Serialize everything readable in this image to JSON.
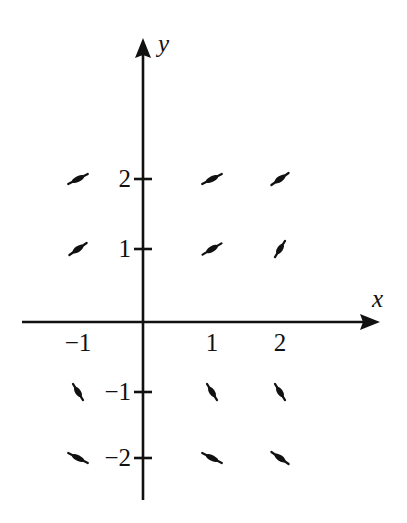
{
  "figure": {
    "type": "direction-field-plot",
    "background_color": "#ffffff",
    "ink_color": "#111111",
    "width": 407,
    "height": 523
  },
  "axes": {
    "x_axis": {
      "label": "x",
      "label_style": "italic",
      "arrow": "right",
      "pixel_y": 322,
      "pixel_x_start": 22,
      "pixel_x_end": 380,
      "tick_labels": [
        "-1",
        "1",
        "2"
      ],
      "tick_label_display": [
        "−1",
        "1",
        "2"
      ],
      "tick_values": [
        -1,
        1,
        2
      ],
      "tick_pixel_x": [
        78,
        212,
        280
      ],
      "tick_label_pixel_y": 330
    },
    "y_axis": {
      "label": "y",
      "label_style": "italic",
      "arrow": "up",
      "pixel_x": 143,
      "pixel_y_start": 38,
      "pixel_y_end": 500,
      "tick_labels": [
        "2",
        "1",
        "-1",
        "-2"
      ],
      "tick_label_display": [
        "2",
        "1",
        "−1",
        "−2"
      ],
      "tick_values": [
        2,
        1,
        -1,
        -2
      ],
      "tick_pixel_y": [
        179,
        249,
        392,
        458
      ],
      "tick_mark_half_width": 9
    },
    "origin_pixel": {
      "x": 143,
      "y": 322
    }
  },
  "chart_data": {
    "type": "scatter",
    "title": "",
    "xlabel": "x",
    "ylabel": "y",
    "grid": false,
    "legend": false,
    "xlim": [
      -1.8,
      2.9
    ],
    "ylim": [
      -2.7,
      2.9
    ],
    "marker": "slope-segment",
    "x": [
      -1,
      1,
      2,
      -1,
      1,
      2,
      -1,
      1,
      2,
      -1,
      1,
      2
    ],
    "y": [
      2,
      2,
      2,
      1,
      1,
      1,
      -1,
      -1,
      -1,
      -2,
      -2,
      -2
    ],
    "slopes": [
      0.5,
      0.5,
      0.7,
      0.7,
      0.7,
      1.6,
      -1.6,
      -1.6,
      -1.6,
      -0.5,
      -0.5,
      -0.7
    ],
    "points": [
      {
        "x": -1,
        "y": 2,
        "slope": 0.5,
        "angle_deg": -27,
        "px": 78,
        "py": 179,
        "length": 22
      },
      {
        "x": 1,
        "y": 2,
        "slope": 0.5,
        "angle_deg": -27,
        "px": 212,
        "py": 179,
        "length": 22
      },
      {
        "x": 2,
        "y": 2,
        "slope": 0.7,
        "angle_deg": -35,
        "px": 280,
        "py": 179,
        "length": 21
      },
      {
        "x": -1,
        "y": 1,
        "slope": 0.7,
        "angle_deg": -35,
        "px": 78,
        "py": 249,
        "length": 21
      },
      {
        "x": 1,
        "y": 1,
        "slope": 0.6,
        "angle_deg": -31,
        "px": 212,
        "py": 249,
        "length": 22
      },
      {
        "x": 2,
        "y": 1,
        "slope": 1.6,
        "angle_deg": -58,
        "px": 280,
        "py": 249,
        "length": 19
      },
      {
        "x": -1,
        "y": -1,
        "slope": -1.6,
        "angle_deg": 58,
        "px": 78,
        "py": 392,
        "length": 19
      },
      {
        "x": 1,
        "y": -1,
        "slope": -1.6,
        "angle_deg": 58,
        "px": 212,
        "py": 392,
        "length": 19
      },
      {
        "x": 2,
        "y": -1,
        "slope": -1.6,
        "angle_deg": 58,
        "px": 280,
        "py": 392,
        "length": 19
      },
      {
        "x": -1,
        "y": -2,
        "slope": -0.5,
        "angle_deg": 27,
        "px": 78,
        "py": 458,
        "length": 22
      },
      {
        "x": 1,
        "y": -2,
        "slope": -0.5,
        "angle_deg": 27,
        "px": 212,
        "py": 458,
        "length": 22
      },
      {
        "x": 2,
        "y": -2,
        "slope": -0.7,
        "angle_deg": 35,
        "px": 280,
        "py": 458,
        "length": 21
      }
    ]
  }
}
